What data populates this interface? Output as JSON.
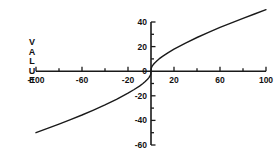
{
  "figure": {
    "background_color": "#ffffff",
    "ink_color": "#1a1a1a"
  },
  "axis_label_vertical": {
    "name": "VALUE",
    "letters": [
      "V",
      "A",
      "L",
      "U",
      "E"
    ]
  },
  "chart_data": {
    "type": "line",
    "title": "",
    "subtitle": "",
    "xlabel": "",
    "ylabel": "VALUE",
    "xlim": [
      -100,
      100
    ],
    "ylim": [
      -60,
      40
    ],
    "grid": false,
    "legend": null,
    "x_major_ticks": [
      -100,
      -80,
      -60,
      -40,
      -20,
      0,
      20,
      40,
      60,
      80,
      100
    ],
    "x_tick_labels": [
      "-100",
      "",
      "-60",
      "",
      "-20",
      "",
      "20",
      "",
      "60",
      "",
      "100"
    ],
    "y_major_ticks": [
      40,
      30,
      20,
      10,
      0,
      -10,
      -20,
      -30,
      -40,
      -50,
      -60
    ],
    "y_tick_labels": [
      "40",
      "",
      "20",
      "",
      "0",
      "",
      "-20",
      "",
      "-40",
      "",
      "-60"
    ],
    "series": [
      {
        "name": "value curve",
        "color": "#1a1a1a",
        "linewidth": 1.4,
        "x": [
          -100,
          -90,
          -80,
          -70,
          -60,
          -50,
          -40,
          -30,
          -20,
          -15,
          -10,
          -7,
          -5,
          -3,
          -2,
          -1,
          -0.5,
          -0.2,
          0,
          0.2,
          0.5,
          1,
          2,
          3,
          5,
          7,
          10,
          15,
          20,
          30,
          40,
          50,
          60,
          70,
          80,
          90,
          100
        ],
        "y": [
          -50.0,
          -46.5,
          -43.0,
          -39.3,
          -35.6,
          -31.6,
          -27.4,
          -22.9,
          -17.9,
          -15.1,
          -12.1,
          -10.0,
          -8.3,
          -6.5,
          -5.4,
          -4.1,
          -3.1,
          -2.1,
          0,
          2.1,
          3.1,
          4.1,
          5.4,
          6.5,
          8.3,
          10.0,
          12.1,
          15.1,
          17.9,
          22.9,
          27.4,
          31.6,
          35.6,
          39.3,
          43.0,
          46.5,
          50.0
        ]
      }
    ]
  }
}
